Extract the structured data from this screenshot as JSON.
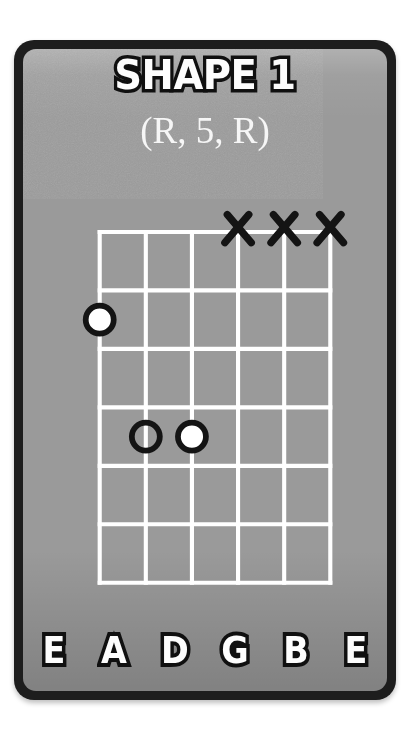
{
  "card": {
    "title": "SHAPE 1",
    "subtitle": "(R, 5, R)",
    "background_color": "#9a9a9a",
    "border_color": "#1d1d1d",
    "line_color": "#ffffff",
    "marker_outline_color": "#141414",
    "marker_fill_color": "#ffffff"
  },
  "diagram": {
    "type": "guitar-chord-shape",
    "string_count": 6,
    "fret_count": 6,
    "strings": [
      {
        "index": 1,
        "name": "E",
        "label": "E",
        "mark": "none"
      },
      {
        "index": 2,
        "name": "A",
        "label": "A",
        "mark": "none"
      },
      {
        "index": 3,
        "name": "D",
        "label": "D",
        "mark": "none"
      },
      {
        "index": 4,
        "name": "G",
        "label": "G",
        "mark": "x"
      },
      {
        "index": 5,
        "name": "B",
        "label": "B",
        "mark": "x"
      },
      {
        "index": 6,
        "name": "E",
        "label": "E",
        "mark": "x"
      }
    ],
    "muted_strings": [
      "G",
      "B",
      "E"
    ],
    "notes": [
      {
        "string_index": 1,
        "string": "E",
        "fret": 2,
        "style": "filled",
        "degree": "R"
      },
      {
        "string_index": 2,
        "string": "A",
        "fret": 4,
        "style": "hollow",
        "degree": "5"
      },
      {
        "string_index": 3,
        "string": "D",
        "fret": 4,
        "style": "filled",
        "degree": "R"
      }
    ],
    "string_labels": [
      "E",
      "A",
      "D",
      "G",
      "B",
      "E"
    ]
  },
  "geometry": {
    "string_x": [
      0,
      56,
      112,
      168,
      224,
      280
    ],
    "fret_y": [
      0,
      71,
      142,
      213,
      284,
      355,
      426
    ],
    "marker_radius": 17,
    "marker_stroke_width": 7
  }
}
